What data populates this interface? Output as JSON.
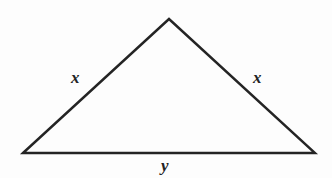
{
  "figure": {
    "name": "isosceles-triangle",
    "background_color": "#fdfdfd",
    "stroke_color": "#242424",
    "stroke_width": 2.4,
    "labels": {
      "left_side": "x",
      "right_side": "x",
      "base": "y"
    }
  },
  "chart_data": {
    "type": "diagram",
    "title": "",
    "shape": "triangle",
    "vertices": [
      {
        "name": "left-vertex",
        "x": 23,
        "y": 153
      },
      {
        "name": "apex-vertex",
        "x": 169,
        "y": 19
      },
      {
        "name": "right-vertex",
        "x": 315,
        "y": 153
      }
    ],
    "edges": [
      {
        "name": "left-side",
        "from": "left-vertex",
        "to": "apex-vertex",
        "label": "x"
      },
      {
        "name": "right-side",
        "from": "apex-vertex",
        "to": "right-vertex",
        "label": "x"
      },
      {
        "name": "base",
        "from": "left-vertex",
        "to": "right-vertex",
        "label": "y"
      }
    ],
    "label_positions": [
      {
        "label": "x",
        "x": 78,
        "y": 78
      },
      {
        "label": "x",
        "x": 259,
        "y": 78
      },
      {
        "label": "y",
        "x": 168,
        "y": 166
      }
    ]
  }
}
